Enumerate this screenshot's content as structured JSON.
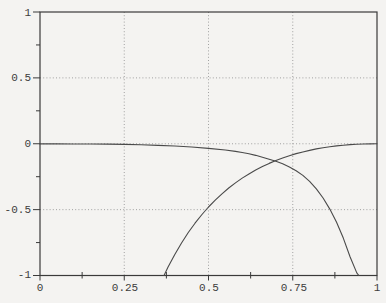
{
  "figure": {
    "background_color": "#f4f3f1",
    "frame_color": "#3a3a3a",
    "grid_color": "#979797",
    "curve_color": "#4a4a4a",
    "label_color": "#3d3d3d"
  },
  "axes": {
    "x_tick_labels": [
      "0",
      "0.25",
      "0.5",
      "0.75",
      "1"
    ],
    "y_tick_labels": [
      "1",
      "0.5",
      "0",
      "-0.5",
      "-1"
    ]
  },
  "chart_data": {
    "type": "line",
    "title": "",
    "xlabel": "",
    "ylabel": "",
    "xlim": [
      0,
      1
    ],
    "ylim": [
      -1,
      1
    ],
    "x_ticks": [
      0,
      0.25,
      0.5,
      0.75,
      1
    ],
    "x_minor_ticks": [
      0.125,
      0.375,
      0.625,
      0.875
    ],
    "y_ticks": [
      1,
      0.5,
      0,
      -0.5,
      -1
    ],
    "y_minor_ticks": [
      0.75,
      0.25,
      -0.25,
      -0.75
    ],
    "grid": {
      "style": "dotted",
      "x_lines": [
        0.25,
        0.5,
        0.75
      ],
      "y_lines": [
        0.5,
        0,
        -0.5
      ]
    },
    "legend": "none",
    "series": [
      {
        "name": "rising-curve",
        "description": "enters plot at bottom near x=0.37, rises to 0 at x=1 (shape of -(ln x)^2)",
        "points": [
          [
            0.368,
            -1.0
          ],
          [
            0.38,
            -0.936
          ],
          [
            0.4,
            -0.84
          ],
          [
            0.42,
            -0.753
          ],
          [
            0.44,
            -0.674
          ],
          [
            0.46,
            -0.603
          ],
          [
            0.48,
            -0.539
          ],
          [
            0.5,
            -0.48
          ],
          [
            0.52,
            -0.428
          ],
          [
            0.54,
            -0.38
          ],
          [
            0.56,
            -0.336
          ],
          [
            0.58,
            -0.297
          ],
          [
            0.6,
            -0.261
          ],
          [
            0.62,
            -0.229
          ],
          [
            0.64,
            -0.199
          ],
          [
            0.66,
            -0.173
          ],
          [
            0.68,
            -0.149
          ],
          [
            0.7,
            -0.127
          ],
          [
            0.72,
            -0.108
          ],
          [
            0.74,
            -0.091
          ],
          [
            0.76,
            -0.075
          ],
          [
            0.78,
            -0.062
          ],
          [
            0.8,
            -0.05
          ],
          [
            0.82,
            -0.039
          ],
          [
            0.84,
            -0.03
          ],
          [
            0.86,
            -0.023
          ],
          [
            0.88,
            -0.016
          ],
          [
            0.9,
            -0.011
          ],
          [
            0.92,
            -0.007
          ],
          [
            0.94,
            -0.004
          ],
          [
            0.96,
            -0.002
          ],
          [
            0.98,
            -0.001
          ],
          [
            1.0,
            0.0
          ]
        ]
      },
      {
        "name": "falling-curve",
        "description": "stays near y=0 from x=0, falls steeply and exits plot at y=-1 near x=0.946",
        "points": [
          [
            0.0,
            -0.001
          ],
          [
            0.05,
            -0.001
          ],
          [
            0.1,
            -0.002
          ],
          [
            0.15,
            -0.002
          ],
          [
            0.2,
            -0.003
          ],
          [
            0.25,
            -0.005
          ],
          [
            0.3,
            -0.008
          ],
          [
            0.35,
            -0.012
          ],
          [
            0.4,
            -0.017
          ],
          [
            0.45,
            -0.025
          ],
          [
            0.5,
            -0.035
          ],
          [
            0.55,
            -0.048
          ],
          [
            0.58,
            -0.058
          ],
          [
            0.6,
            -0.066
          ],
          [
            0.62,
            -0.076
          ],
          [
            0.64,
            -0.088
          ],
          [
            0.66,
            -0.102
          ],
          [
            0.68,
            -0.118
          ],
          [
            0.7,
            -0.133
          ],
          [
            0.72,
            -0.152
          ],
          [
            0.74,
            -0.176
          ],
          [
            0.76,
            -0.205
          ],
          [
            0.78,
            -0.24
          ],
          [
            0.8,
            -0.285
          ],
          [
            0.82,
            -0.342
          ],
          [
            0.84,
            -0.412
          ],
          [
            0.86,
            -0.496
          ],
          [
            0.88,
            -0.596
          ],
          [
            0.9,
            -0.716
          ],
          [
            0.92,
            -0.858
          ],
          [
            0.94,
            -0.98
          ],
          [
            0.946,
            -1.0
          ]
        ]
      }
    ],
    "crossing_point_approx": [
      0.71,
      -0.13
    ]
  }
}
